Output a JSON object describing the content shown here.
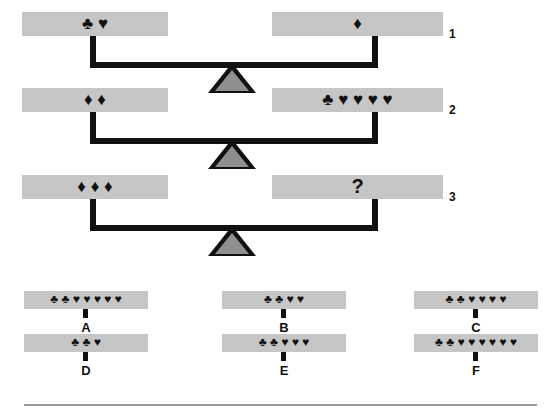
{
  "puzzle": {
    "type": "balance-scale-logic-puzzle",
    "glyph_map": {
      "club": "♣",
      "heart": "♥",
      "diamond": "♦",
      "question": "?"
    },
    "rows": [
      {
        "label": "1",
        "left": {
          "glyphs": "♣ ♥",
          "counts": {
            "club": 1,
            "heart": 1,
            "diamond": 0
          }
        },
        "right": {
          "glyphs": "♦",
          "counts": {
            "club": 0,
            "heart": 0,
            "diamond": 1
          }
        },
        "relation": "balanced"
      },
      {
        "label": "2",
        "left": {
          "glyphs": "♦ ♦",
          "counts": {
            "club": 0,
            "heart": 0,
            "diamond": 2
          }
        },
        "right": {
          "glyphs": "♣ ♥ ♥ ♥ ♥",
          "counts": {
            "club": 1,
            "heart": 4,
            "diamond": 0
          }
        },
        "relation": "balanced"
      },
      {
        "label": "3",
        "left": {
          "glyphs": "♦ ♦ ♦",
          "counts": {
            "club": 0,
            "heart": 0,
            "diamond": 3
          }
        },
        "right": {
          "glyphs": "?",
          "counts": null
        },
        "relation": "balanced"
      }
    ],
    "options": [
      {
        "letter": "A",
        "glyphs": "♣ ♣ ♥ ♥ ♥ ♥ ♥",
        "counts": {
          "club": 2,
          "heart": 5
        }
      },
      {
        "letter": "B",
        "glyphs": "♣ ♣ ♥ ♥",
        "counts": {
          "club": 2,
          "heart": 2
        }
      },
      {
        "letter": "C",
        "glyphs": "♣ ♣ ♥ ♥ ♥ ♥",
        "counts": {
          "club": 2,
          "heart": 4
        }
      },
      {
        "letter": "D",
        "glyphs": "♣ ♣ ♥",
        "counts": {
          "club": 2,
          "heart": 1
        }
      },
      {
        "letter": "E",
        "glyphs": "♣ ♣ ♥ ♥ ♥",
        "counts": {
          "club": 2,
          "heart": 3
        }
      },
      {
        "letter": "F",
        "glyphs": "♣ ♣ ♥ ♥ ♥ ♥ ♥ ♥",
        "counts": {
          "club": 2,
          "heart": 6
        }
      }
    ],
    "colors": {
      "pan_fill": "#c6c6c6",
      "beam": "#111111",
      "fulcrum_fill": "#8f8f8f",
      "fulcrum_border": "#111111",
      "rule": "#9a9a9a",
      "background": "#ffffff"
    }
  }
}
